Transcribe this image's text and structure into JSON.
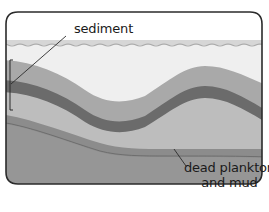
{
  "figure": {
    "labels": {
      "sediment": "sediment",
      "dead_plankton_line1": "dead plankton",
      "dead_plankton_line2": "and mud"
    },
    "colors": {
      "frame": "#2b2b2b",
      "sky": "#ffffff",
      "water_surface": "#c8c8c8",
      "water": "#efefef",
      "sediment_light_upper": "#a9a9a9",
      "sediment_dark": "#6b6b6b",
      "sediment_light_lower": "#bdbdbd",
      "plankton_mud_band": "#8c8c8c",
      "ground": "#969696",
      "leader_line": "#2b2b2b"
    }
  }
}
